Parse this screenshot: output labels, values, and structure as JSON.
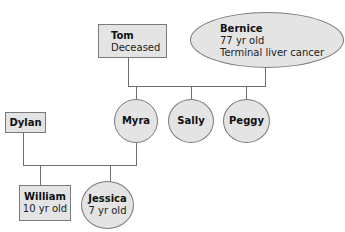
{
  "diagram": {
    "type": "family-genogram",
    "colors": {
      "node_fill": "#e4e4e4",
      "node_border": "#7a7a7a",
      "line": "#6e6e6e"
    },
    "people": {
      "tom": {
        "name": "Tom",
        "detail": "Deceased",
        "shape": "box"
      },
      "bernice": {
        "name": "Bernice",
        "detail_1": "77 yr old",
        "detail_2": "Terminal liver cancer",
        "shape": "ellipse"
      },
      "myra": {
        "name": "Myra",
        "shape": "circle"
      },
      "sally": {
        "name": "Sally",
        "shape": "circle"
      },
      "peggy": {
        "name": "Peggy",
        "shape": "circle"
      },
      "dylan": {
        "name": "Dylan",
        "shape": "box"
      },
      "william": {
        "name": "William",
        "detail": "10 yr old",
        "shape": "box"
      },
      "jessica": {
        "name": "Jessica",
        "detail": "7 yr old",
        "shape": "ellipse"
      }
    },
    "relationships": [
      {
        "parents": [
          "Tom",
          "Bernice"
        ],
        "children": [
          "Myra",
          "Sally",
          "Peggy"
        ]
      },
      {
        "parents": [
          "Dylan",
          "Myra"
        ],
        "children": [
          "William",
          "Jessica"
        ]
      }
    ]
  }
}
